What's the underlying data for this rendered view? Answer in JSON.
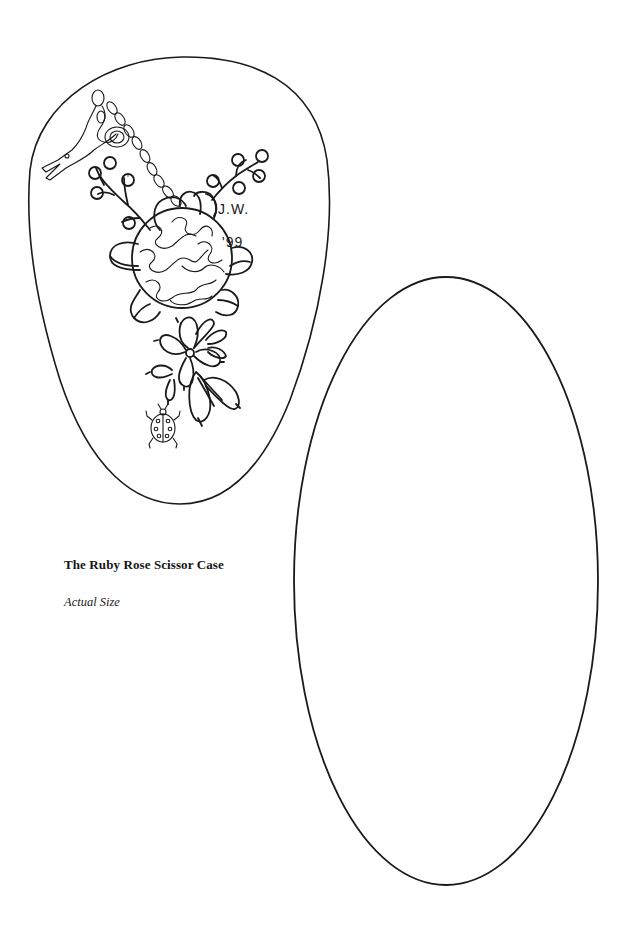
{
  "page": {
    "background": "#ffffff",
    "line_color": "#1a1a1a"
  },
  "caption": {
    "title": "The Ruby Rose Scissor Case",
    "subtitle": "Actual Size"
  },
  "front_piece": {
    "shape": "egg-outline",
    "embroidery": {
      "initials_line1": "J.W.",
      "initials_line2": "'99",
      "motifs": [
        "scissors",
        "chain-stitch-cord",
        "berry-sprigs",
        "woven-rose",
        "petals",
        "five-petal-flower",
        "rosebuds",
        "ladybug"
      ]
    }
  },
  "back_piece": {
    "shape": "oval-outline"
  }
}
